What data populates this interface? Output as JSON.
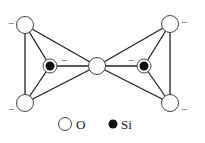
{
  "diagram": {
    "colors": {
      "line": "#222222",
      "oxygen_fill": "#ffffff",
      "si_fill": "#111111"
    },
    "oxygen_atoms": [
      {
        "id": "O1",
        "x": 25,
        "y": 25,
        "charge": "−",
        "cx": 11,
        "cy": 24
      },
      {
        "id": "O2",
        "x": 25,
        "y": 103,
        "charge": "−",
        "cx": 11,
        "cy": 110
      },
      {
        "id": "O3",
        "x": 97,
        "y": 66,
        "charge": "",
        "cx": 0,
        "cy": 0
      },
      {
        "id": "O4",
        "x": 170,
        "y": 24,
        "charge": "−",
        "cx": 182,
        "cy": 24
      },
      {
        "id": "O5",
        "x": 170,
        "y": 103,
        "charge": "−",
        "cx": 182,
        "cy": 110
      }
    ],
    "si_atoms": [
      {
        "id": "Si1",
        "x": 50,
        "y": 66,
        "charge": "−",
        "cx": 64,
        "cy": 61
      },
      {
        "id": "Si2",
        "x": 144,
        "y": 66,
        "charge": "−",
        "cx": 130,
        "cy": 61
      }
    ],
    "legend": {
      "oxygen_label": "O",
      "si_label": "Si"
    }
  }
}
